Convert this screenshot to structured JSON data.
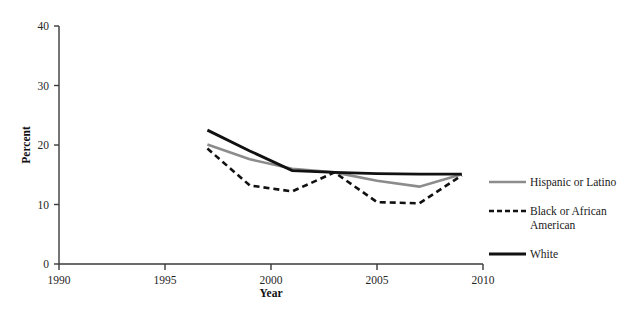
{
  "chart_data": {
    "type": "line",
    "title": "",
    "xlabel": "Year",
    "ylabel": "Percent",
    "xlim": [
      1990,
      2010
    ],
    "ylim": [
      0,
      40
    ],
    "xticks": [
      1990,
      1995,
      2000,
      2005,
      2010
    ],
    "yticks": [
      0,
      10,
      20,
      30,
      40
    ],
    "xtick_labels": [
      "1990",
      "1995",
      "2000",
      "2005",
      "2010"
    ],
    "ytick_labels": [
      "0",
      "10",
      "20",
      "30",
      "40"
    ],
    "grid": false,
    "legend_position": "right",
    "x": [
      1997,
      1999,
      2001,
      2003,
      2005,
      2007,
      2009
    ],
    "series": [
      {
        "name": "Hispanic or Latino",
        "color": "#8c8c8c",
        "style": "solid",
        "width": 2.6,
        "values": [
          20.1,
          17.6,
          16.0,
          15.4,
          14.0,
          13.0,
          15.1
        ]
      },
      {
        "name": "Black or African American",
        "color": "#111111",
        "style": "dashed",
        "width": 2.6,
        "values": [
          19.4,
          13.2,
          12.2,
          15.4,
          10.4,
          10.2,
          14.9
        ]
      },
      {
        "name": "White",
        "color": "#111111",
        "style": "solid",
        "width": 2.8,
        "values": [
          22.5,
          19.0,
          15.7,
          15.4,
          15.2,
          15.1,
          15.1
        ]
      }
    ]
  },
  "axis": {
    "y_title": "Percent",
    "x_title": "Year"
  },
  "legend": {
    "entries": [
      {
        "label": "Hispanic or Latino",
        "label_line2": ""
      },
      {
        "label": "Black or African",
        "label_line2": "American"
      },
      {
        "label": "White",
        "label_line2": ""
      }
    ]
  }
}
